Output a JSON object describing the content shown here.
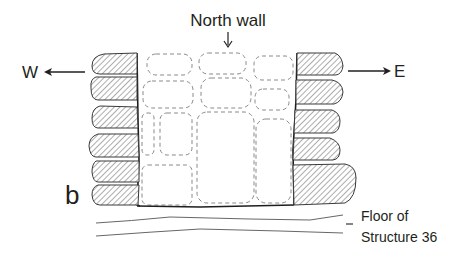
{
  "figure": {
    "panel_label": "b",
    "north_wall_label": "North wall",
    "west_label": "W",
    "east_label": "E",
    "floor_label_line1": "Floor of",
    "floor_label_line2": "Structure 36"
  },
  "legend": {
    "hatched_stones": "facing stones (section)",
    "dashed_stones": "stones of north wall behind"
  },
  "colors": {
    "ink": "#231f20",
    "dashed_outline": "#8a8a8a",
    "background": "#ffffff"
  }
}
